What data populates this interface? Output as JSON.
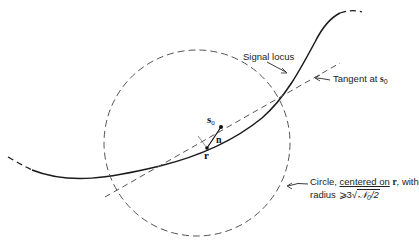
{
  "figure": {
    "labels": {
      "signal_locus": "Signal locus",
      "tangent_prefix": "Tangent at ",
      "tangent_symbol": "s",
      "tangent_sub": "0",
      "circle_line1_prefix": "Circle, ",
      "circle_line1_underlined": "centered on",
      "circle_line1_symbol": "r",
      "circle_line1_suffix": ", with",
      "circle_line2_prefix": "radius ",
      "circle_line2_relation": "⩾",
      "circle_line2_coeff": "3",
      "circle_line2_radical_sign": "√",
      "circle_line2_radicand": "𝒩",
      "circle_line2_radicand_sub": "0",
      "circle_line2_radicand_tail": "/2"
    },
    "points": {
      "s0_symbol": "s",
      "s0_sub": "0",
      "r_symbol": "r",
      "n_symbol": "n"
    },
    "colors": {
      "curve": "#1a1a1a",
      "dashed": "#555555",
      "text": "#222222"
    }
  }
}
